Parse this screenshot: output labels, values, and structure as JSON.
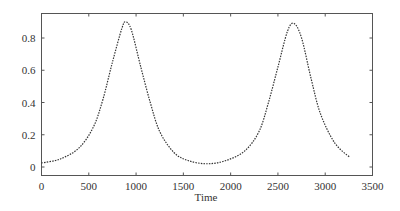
{
  "chart_data": {
    "type": "line",
    "title": "",
    "xlabel": "Time",
    "ylabel": "",
    "xlim": [
      0,
      3500
    ],
    "ylim": [
      -0.03,
      0.95
    ],
    "xticks": [
      0,
      500,
      1000,
      1500,
      2000,
      2500,
      3000,
      3500
    ],
    "xtick_labels": [
      "0",
      "500",
      "1000",
      "1500",
      "2000",
      "2500",
      "3000",
      "3500"
    ],
    "yticks": [
      0,
      0.2,
      0.4,
      0.6,
      0.8
    ],
    "ytick_labels": [
      "0",
      "0.2",
      "0.4",
      "0.6",
      "0.8"
    ],
    "grid": false,
    "legend": null,
    "series": [
      {
        "name": "series-1",
        "line_style": "dotted",
        "color": "#333333",
        "x": [
          0,
          200,
          400,
          550,
          650,
          750,
          850,
          890,
          950,
          1050,
          1150,
          1250,
          1400,
          1550,
          1750,
          1950,
          2150,
          2300,
          2400,
          2500,
          2600,
          2670,
          2750,
          2850,
          2950,
          3100,
          3260
        ],
        "y": [
          0.025,
          0.05,
          0.12,
          0.25,
          0.42,
          0.65,
          0.86,
          0.9,
          0.85,
          0.62,
          0.4,
          0.22,
          0.09,
          0.04,
          0.02,
          0.04,
          0.1,
          0.22,
          0.4,
          0.62,
          0.84,
          0.89,
          0.8,
          0.55,
          0.33,
          0.15,
          0.06
        ]
      }
    ]
  }
}
